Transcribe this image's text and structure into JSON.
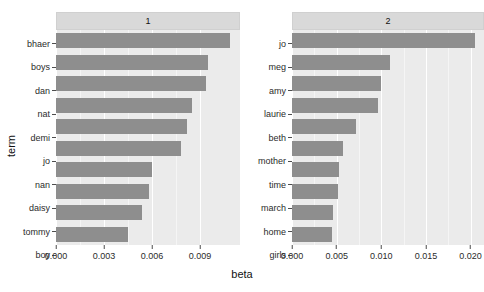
{
  "chart_data": {
    "type": "bar",
    "orientation": "horizontal",
    "title": "",
    "xlabel": "beta",
    "ylabel": "term",
    "grid": true,
    "legend": false,
    "facets": [
      {
        "strip_label": "1",
        "xlim": [
          0,
          0.0115
        ],
        "xticks": [
          0.0,
          0.003,
          0.006,
          0.009
        ],
        "xticklabels": [
          "0.000",
          "0.003",
          "0.006",
          "0.009"
        ],
        "categories": [
          "bhaer",
          "boys",
          "dan",
          "nat",
          "demi",
          "jo",
          "nan",
          "daisy",
          "tommy",
          "boy"
        ],
        "values": [
          0.0109,
          0.0095,
          0.0094,
          0.0085,
          0.0082,
          0.0078,
          0.006,
          0.0058,
          0.0054,
          0.0045
        ]
      },
      {
        "strip_label": "2",
        "xlim": [
          0,
          0.0215
        ],
        "xticks": [
          0.0,
          0.005,
          0.01,
          0.015,
          0.02
        ],
        "xticklabels": [
          "0.000",
          "0.005",
          "0.010",
          "0.015",
          "0.020"
        ],
        "categories": [
          "jo",
          "meg",
          "amy",
          "laurie",
          "beth",
          "mother",
          "time",
          "march",
          "home",
          "girls"
        ],
        "values": [
          0.0205,
          0.011,
          0.01,
          0.0096,
          0.0072,
          0.0057,
          0.0053,
          0.0051,
          0.0046,
          0.0045
        ]
      }
    ],
    "colors": {
      "bar_fill": "#8e8e8e",
      "panel_background": "#ebebeb",
      "strip_background": "#d9d9d9",
      "gridline": "#ffffff",
      "text": "#2b2b2b",
      "figure_background": "#ffffff"
    }
  }
}
